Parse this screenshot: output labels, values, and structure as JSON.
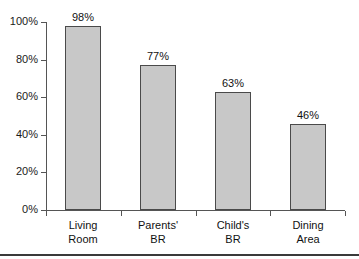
{
  "chart_data": {
    "type": "bar",
    "title": "",
    "subtitle": "",
    "xlabel": "",
    "ylabel": "",
    "categories": [
      "Living Room",
      "Parents' BR",
      "Child's BR",
      "Dining Area"
    ],
    "category_lines": [
      [
        "Living",
        "Room"
      ],
      [
        "Parents'",
        "BR"
      ],
      [
        "Child's",
        "BR"
      ],
      [
        "Dining",
        "Area"
      ]
    ],
    "values": [
      98,
      77,
      63,
      46
    ],
    "value_labels": [
      "98%",
      "77%",
      "63%",
      "46%"
    ],
    "ylim": [
      0,
      100
    ],
    "yticks": [
      0,
      20,
      40,
      60,
      80,
      100
    ],
    "ytick_labels": [
      "0%",
      "20%",
      "40%",
      "60%",
      "80%",
      "100%"
    ],
    "grid": false,
    "legend": false,
    "legend_position": "none",
    "bar_fill_color": "#c8c8c8",
    "bar_edge_color": "#4a4a4a",
    "axis_color": "#555555",
    "text_color": "#111111",
    "background_color": "#ffffff"
  }
}
